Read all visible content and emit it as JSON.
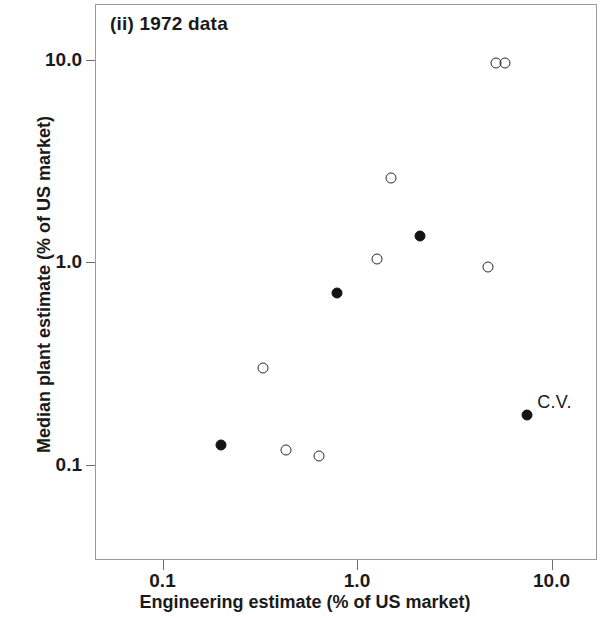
{
  "chart_data": {
    "type": "scatter",
    "title": "(ii) 1972 data",
    "xlabel": "Engineering estimate (% of US market)",
    "ylabel": "Median plant estimate (% of US market)",
    "xscale": "log",
    "yscale": "log",
    "xlim": [
      0.045,
      19.0
    ],
    "ylim": [
      0.055,
      21.0
    ],
    "grid": false,
    "legend": null,
    "xticks": [
      {
        "value": 0.1,
        "label": "0.1"
      },
      {
        "value": 1.0,
        "label": "1.0"
      },
      {
        "value": 10.0,
        "label": "10.0"
      }
    ],
    "yticks": [
      {
        "value": 10.0,
        "label": "10.0"
      },
      {
        "value": 1.0,
        "label": "1.0"
      },
      {
        "value": 0.1,
        "label": "0.1"
      }
    ],
    "series": [
      {
        "name": "open-markers",
        "marker": "open-circle",
        "color": "#2b2b2b",
        "points": [
          {
            "x": 5.2,
            "y": 9.6
          },
          {
            "x": 5.75,
            "y": 9.6
          },
          {
            "x": 1.5,
            "y": 2.6
          },
          {
            "x": 1.27,
            "y": 1.04
          },
          {
            "x": 4.7,
            "y": 0.95
          },
          {
            "x": 0.33,
            "y": 0.3
          },
          {
            "x": 0.43,
            "y": 0.118
          },
          {
            "x": 0.64,
            "y": 0.11
          }
        ]
      },
      {
        "name": "filled-markers",
        "marker": "filled-circle",
        "color": "#141414",
        "points": [
          {
            "x": 2.1,
            "y": 1.35
          },
          {
            "x": 0.79,
            "y": 0.7
          },
          {
            "x": 0.2,
            "y": 0.125
          },
          {
            "x": 7.5,
            "y": 0.175,
            "label": "C.V."
          }
        ]
      }
    ],
    "annotations": [
      {
        "text": "C.V.",
        "x": 7.5,
        "y": 0.175
      }
    ]
  }
}
